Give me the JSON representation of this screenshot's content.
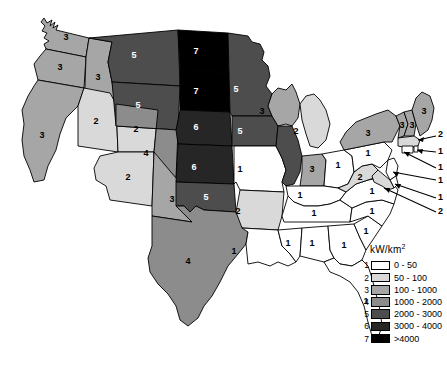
{
  "map": {
    "title": "United States wind power density by state",
    "unit_label": "kW/km",
    "unit_sup": "2"
  },
  "legend": {
    "title": "kW/km²",
    "entries": [
      {
        "num": "1",
        "label": "0 - 50",
        "color": "#ffffff"
      },
      {
        "num": "2",
        "label": "50 - 100",
        "color": "#d9d9d9"
      },
      {
        "num": "3",
        "label": "100 - 1000",
        "color": "#a6a6a6"
      },
      {
        "num": "4",
        "label": "1000 - 2000",
        "color": "#8c8c8c"
      },
      {
        "num": "5",
        "label": "2000 - 3000",
        "color": "#4d4d4d"
      },
      {
        "num": "6",
        "label": "3000 - 4000",
        "color": "#262626"
      },
      {
        "num": "7",
        "label": ">4000",
        "color": "#000000"
      }
    ]
  },
  "chart_data": {
    "type": "map",
    "value_label": "kW/km²",
    "classes": [
      {
        "num": 1,
        "range": "0 - 50",
        "color": "#ffffff"
      },
      {
        "num": 2,
        "range": "50 - 100",
        "color": "#d9d9d9"
      },
      {
        "num": 3,
        "range": "100 - 1000",
        "color": "#a6a6a6"
      },
      {
        "num": 4,
        "range": "1000 - 2000",
        "color": "#8c8c8c"
      },
      {
        "num": 5,
        "range": "2000 - 3000",
        "color": "#4d4d4d"
      },
      {
        "num": 6,
        "range": "3000 - 4000",
        "color": "#262626"
      },
      {
        "num": 7,
        "range": ">4000",
        "color": "#000000"
      }
    ],
    "states": [
      {
        "code": "WA",
        "name": "Washington",
        "class": 3,
        "label": "3"
      },
      {
        "code": "OR",
        "name": "Oregon",
        "class": 3,
        "label": "3"
      },
      {
        "code": "CA",
        "name": "California",
        "class": 3,
        "label": "3"
      },
      {
        "code": "ID",
        "name": "Idaho",
        "class": 3,
        "label": "3"
      },
      {
        "code": "NV",
        "name": "Nevada",
        "class": 2,
        "label": "2"
      },
      {
        "code": "UT",
        "name": "Utah",
        "class": 2,
        "label": "2"
      },
      {
        "code": "AZ",
        "name": "Arizona",
        "class": 2,
        "label": "2"
      },
      {
        "code": "MT",
        "name": "Montana",
        "class": 5,
        "label": "5"
      },
      {
        "code": "WY",
        "name": "Wyoming",
        "class": 5,
        "label": "5"
      },
      {
        "code": "CO",
        "name": "Colorado",
        "class": 4,
        "label": "4"
      },
      {
        "code": "NM",
        "name": "New Mexico",
        "class": 3,
        "label": "3"
      },
      {
        "code": "ND",
        "name": "North Dakota",
        "class": 7,
        "label": "7"
      },
      {
        "code": "SD",
        "name": "South Dakota",
        "class": 7,
        "label": "7"
      },
      {
        "code": "NE",
        "name": "Nebraska",
        "class": 6,
        "label": "6"
      },
      {
        "code": "KS",
        "name": "Kansas",
        "class": 6,
        "label": "6"
      },
      {
        "code": "OK",
        "name": "Oklahoma",
        "class": 5,
        "label": "5"
      },
      {
        "code": "TX",
        "name": "Texas",
        "class": 4,
        "label": "4"
      },
      {
        "code": "MN",
        "name": "Minnesota",
        "class": 5,
        "label": "5"
      },
      {
        "code": "IA",
        "name": "Iowa",
        "class": 5,
        "label": "5"
      },
      {
        "code": "MO",
        "name": "Missouri",
        "class": 1,
        "label": "1"
      },
      {
        "code": "AR",
        "name": "Arkansas",
        "class": 2,
        "label": "2"
      },
      {
        "code": "LA",
        "name": "Louisiana",
        "class": 1,
        "label": "1"
      },
      {
        "code": "WI",
        "name": "Wisconsin",
        "class": 3,
        "label": "3"
      },
      {
        "code": "IL",
        "name": "Illinois",
        "class": 5,
        "label": "5"
      },
      {
        "code": "MI",
        "name": "Michigan",
        "class": 2,
        "label": "2"
      },
      {
        "code": "IN",
        "name": "Indiana",
        "class": 3,
        "label": "3"
      },
      {
        "code": "OH",
        "name": "Ohio",
        "class": 1,
        "label": "1"
      },
      {
        "code": "KY",
        "name": "Kentucky",
        "class": 1,
        "label": "1"
      },
      {
        "code": "TN",
        "name": "Tennessee",
        "class": 1,
        "label": "1"
      },
      {
        "code": "MS",
        "name": "Mississippi",
        "class": 1,
        "label": "1"
      },
      {
        "code": "AL",
        "name": "Alabama",
        "class": 1,
        "label": "1"
      },
      {
        "code": "GA",
        "name": "Georgia",
        "class": 1,
        "label": "1"
      },
      {
        "code": "FL",
        "name": "Florida",
        "class": 1,
        "label": "1"
      },
      {
        "code": "SC",
        "name": "South Carolina",
        "class": 1,
        "label": "1"
      },
      {
        "code": "NC",
        "name": "North Carolina",
        "class": 1,
        "label": "1"
      },
      {
        "code": "VA",
        "name": "Virginia",
        "class": 1,
        "label": "1"
      },
      {
        "code": "WV",
        "name": "West Virginia",
        "class": 2,
        "label": "2"
      },
      {
        "code": "PA",
        "name": "Pennsylvania",
        "class": 1,
        "label": "1"
      },
      {
        "code": "NY",
        "name": "New York",
        "class": 3,
        "label": "3"
      },
      {
        "code": "VT",
        "name": "Vermont",
        "class": 3,
        "label": "3"
      },
      {
        "code": "NH",
        "name": "New Hampshire",
        "class": 3,
        "label": "3"
      },
      {
        "code": "ME",
        "name": "Maine",
        "class": 3,
        "label": "3"
      },
      {
        "code": "MA",
        "name": "Massachusetts",
        "class": 2,
        "label": "2"
      },
      {
        "code": "RI",
        "name": "Rhode Island",
        "class": 1,
        "label": "1"
      },
      {
        "code": "CT",
        "name": "Connecticut",
        "class": 1,
        "label": "1"
      },
      {
        "code": "NJ",
        "name": "New Jersey",
        "class": 1,
        "label": "1"
      },
      {
        "code": "DE",
        "name": "Delaware",
        "class": 1,
        "label": "1"
      },
      {
        "code": "MD",
        "name": "Maryland",
        "class": 2,
        "label": "2"
      }
    ],
    "callouts": [
      {
        "code": "MA",
        "label": "2"
      },
      {
        "code": "RI",
        "label": "1"
      },
      {
        "code": "CT",
        "label": "1"
      },
      {
        "code": "NJ",
        "label": "1"
      },
      {
        "code": "DE",
        "label": "1"
      },
      {
        "code": "MD",
        "label": "2"
      }
    ]
  }
}
